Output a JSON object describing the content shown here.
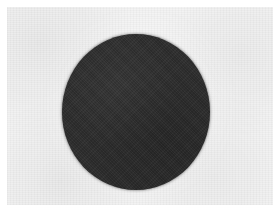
{
  "image": {
    "kind": "scanned-figure",
    "width": 280,
    "height": 212,
    "caption": "",
    "background_color": "#f2f2f2",
    "page_margin_color": "#ffffff",
    "page_margin_px": 7,
    "texture": "paper-grain"
  },
  "shapes": [
    {
      "name": "dark-disc",
      "type": "circle",
      "fill": "#2e2e2e",
      "center_x": 136,
      "center_y": 112,
      "radius_x": 74,
      "radius_y": 78,
      "left": 62,
      "top": 34,
      "width": 148,
      "height": 156,
      "edge": "soft",
      "label": ""
    }
  ],
  "annotations": {
    "text_items": [],
    "has_text": false,
    "has_axes": false,
    "has_legend": false
  }
}
